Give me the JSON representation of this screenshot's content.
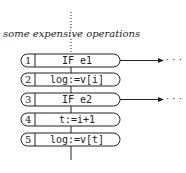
{
  "diagram": {
    "annotation": "some expensive operations",
    "nodes": [
      {
        "num": "1",
        "code": "IF e1",
        "branch": true
      },
      {
        "num": "2",
        "code": "log:=v[i]",
        "branch": false
      },
      {
        "num": "3",
        "code": "IF e2",
        "branch": true
      },
      {
        "num": "4",
        "code": "t:=i+1",
        "branch": false
      },
      {
        "num": "5",
        "code": "log:=v[t]",
        "branch": false
      }
    ],
    "branch_continuation": "· · ·",
    "colors": {
      "stroke": "#222222",
      "background": "#ffffff"
    }
  }
}
